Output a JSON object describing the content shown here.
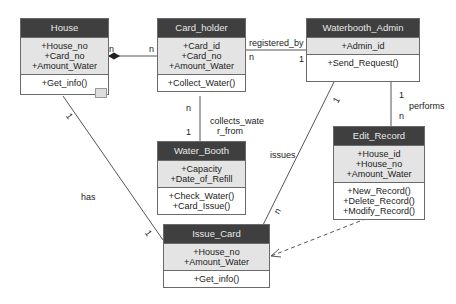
{
  "classes": {
    "house": {
      "name": "House",
      "attributes": [
        "+House_no",
        "+Card_no",
        "+Amount_Water"
      ],
      "operations": [
        "+Get_info()"
      ]
    },
    "card_holder": {
      "name": "Card_holder",
      "attributes": [
        "+Card_id",
        "+Card_no",
        "+Amount_Water"
      ],
      "operations": [
        "+Collect_Water()"
      ]
    },
    "waterbooth_admin": {
      "name": "Waterbooth_Admin",
      "attributes": [
        "+Admin_id"
      ],
      "operations": [
        "+Send_Request()"
      ]
    },
    "water_booth": {
      "name": "Water_Booth",
      "attributes": [
        "+Capacity",
        "+Date_of_Refill"
      ],
      "operations": [
        "+Check_Water()",
        "+Card_Issue()"
      ]
    },
    "edit_record": {
      "name": "Edit_Record",
      "attributes": [
        "+House_id",
        "+House_no",
        "+Amount_Water"
      ],
      "operations": [
        "+New_Record()",
        "+Delete_Record()",
        "+Modify_Record()"
      ]
    },
    "issue_card": {
      "name": "Issue_Card",
      "attributes": [
        "+House_no",
        "+Amount_Water"
      ],
      "operations": [
        "+Get_info()"
      ]
    }
  },
  "associations": {
    "house_cardholder": {
      "mult_a": "n",
      "mult_b": "n"
    },
    "registered_by": {
      "label": "registered_by",
      "mult_a": "n",
      "mult_b": "1"
    },
    "collects_water_from": {
      "label_1": "collects_wate",
      "label_2": "r_from",
      "mult_a": "n",
      "mult_b": "1"
    },
    "performs": {
      "label": "performs",
      "mult_a": "1",
      "mult_b": "n"
    },
    "issues": {
      "label": "issues",
      "mult_a": "1",
      "mult_b": "n"
    },
    "has": {
      "label": "has",
      "mult_a": "1",
      "mult_b": "1"
    }
  }
}
